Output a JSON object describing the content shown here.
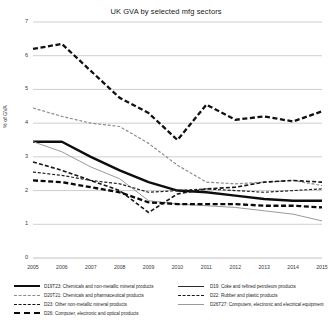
{
  "chart": {
    "title": "UK GVA by selected mfg sectors",
    "ylabel": "% of GVA"
  },
  "legend": {
    "left": [
      {
        "label": "D19T23: Chemicals and non-metallic mineral products",
        "swatch": "solid-thick-dark"
      },
      {
        "label": "D20T21: Chemicals and pharmaceutical products",
        "swatch": "dash-grey-long"
      },
      {
        "label": "D23: Other non-metallic mineral products",
        "swatch": "dash-dark-med"
      },
      {
        "label": "D26: Computer, electronic and optical products",
        "swatch": "dash-dark-bold"
      }
    ],
    "right": [
      {
        "label": "D19: Coke and refined petroleum products",
        "swatch": "solid-dark-thin"
      },
      {
        "label": "D22: Rubber and plastic products",
        "swatch": "dash-dark-fine"
      },
      {
        "label": "D26T27: Computers, electronic and electrical equipment",
        "swatch": "solid-grey-thin"
      }
    ]
  },
  "chart_data": {
    "type": "line",
    "title": "UK GVA by selected mfg sectors",
    "xlabel": "",
    "ylabel": "% of GVA",
    "x": [
      2005,
      2006,
      2007,
      2008,
      2009,
      2010,
      2011,
      2012,
      2013,
      2014,
      2015
    ],
    "xtick_labels": [
      "2005",
      "2006",
      "2007",
      "2008",
      "2009",
      "2010",
      "2011",
      "2012",
      "2013",
      "2014",
      "2015"
    ],
    "ytick_labels": [
      "0",
      "1",
      "2",
      "3",
      "4",
      "5",
      "6",
      "7"
    ],
    "ylim": [
      0,
      7
    ],
    "ytick_step": 1,
    "grid": "horizontal",
    "legend_position": "bottom",
    "series": [
      {
        "name": "D19: Coke and refined petroleum products",
        "code": "D19",
        "style": "dashed",
        "color": "#111111",
        "width": 2.3,
        "values": [
          6.2,
          6.35,
          5.55,
          4.75,
          4.3,
          3.5,
          4.55,
          4.1,
          4.2,
          4.05,
          4.35
        ]
      },
      {
        "name": "D20T21: Chemicals and pharmaceutical products",
        "code": "D20T21",
        "style": "dashed",
        "color": "#8d8d8d",
        "width": 1.2,
        "values": [
          4.45,
          4.2,
          4.0,
          3.9,
          3.4,
          2.75,
          2.25,
          2.2,
          2.25,
          2.3,
          2.15
        ]
      },
      {
        "name": "D19T23: Chemicals and non-metallic mineral products",
        "code": "D19T23",
        "style": "solid",
        "color": "#0d0d0d",
        "width": 2.4,
        "values": [
          3.45,
          3.45,
          3.0,
          2.6,
          2.25,
          2.0,
          1.95,
          1.85,
          1.75,
          1.7,
          1.7
        ]
      },
      {
        "name": "D26T27: Computers, electronic and electrical equipment",
        "code": "D26T27",
        "style": "solid",
        "color": "#9a9a9a",
        "width": 1.0,
        "values": [
          3.45,
          3.15,
          2.7,
          2.35,
          1.7,
          1.6,
          1.55,
          1.5,
          1.4,
          1.3,
          1.1
        ]
      },
      {
        "name": "D23: Other non-metallic mineral products",
        "code": "D23",
        "style": "dashed",
        "color": "#161616",
        "width": 1.6,
        "values": [
          2.85,
          2.6,
          2.3,
          2.0,
          1.35,
          1.9,
          2.05,
          2.1,
          2.25,
          2.3,
          2.25
        ]
      },
      {
        "name": "D22: Rubber and plastic products",
        "code": "D22",
        "style": "dashed",
        "color": "#222222",
        "width": 1.2,
        "values": [
          2.55,
          2.45,
          2.3,
          2.2,
          1.95,
          2.0,
          2.05,
          2.0,
          1.95,
          2.0,
          2.05
        ]
      },
      {
        "name": "D26: Computer, electronic and optical products",
        "code": "D26",
        "style": "dashed",
        "color": "#0a0a0a",
        "width": 2.3,
        "values": [
          2.3,
          2.25,
          2.1,
          1.95,
          1.65,
          1.6,
          1.6,
          1.6,
          1.55,
          1.55,
          1.5
        ]
      }
    ]
  }
}
